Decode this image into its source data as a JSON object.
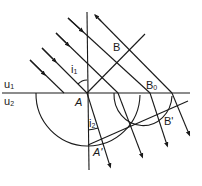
{
  "diagram": {
    "type": "huygens-refraction",
    "colors": {
      "stroke": "#1a1a1a",
      "background": "#ffffff"
    },
    "labels": {
      "medium1": {
        "base": "u",
        "sub": "1"
      },
      "medium2": {
        "base": "u",
        "sub": "2"
      },
      "point_A": "A",
      "point_B": "B",
      "point_B0": {
        "base": "B",
        "sub": "0"
      },
      "point_B_prime": "B'",
      "point_A_prime": "A'",
      "angle_incidence": {
        "base": "i",
        "sub": "1"
      },
      "angle_refraction": {
        "base": "i",
        "sub": "2"
      }
    }
  }
}
